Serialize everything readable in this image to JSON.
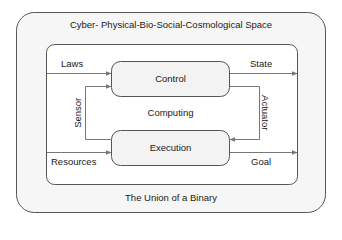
{
  "diagram": {
    "outer_title": "Cyber- Physical-Bio-Social-Cosmological Space",
    "bottom_label": "The Union of a Binary",
    "center_label": "Computing",
    "boxes": {
      "control": "Control",
      "execution": "Execution"
    },
    "arrows": {
      "laws": "Laws",
      "state": "State",
      "sensor": "Sensor",
      "actuator": "Actuator",
      "resources": "Resources",
      "goal": "Goal"
    }
  },
  "colors": {
    "outer_fill": "#f6f6f6",
    "inner_fill": "#ffffff",
    "box_fill": "#f3f3f3",
    "stroke": "#555555",
    "arrow": "#777777"
  }
}
